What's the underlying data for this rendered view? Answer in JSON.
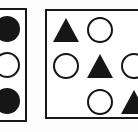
{
  "figure": {
    "title": "",
    "background_color": "#fdfdfd",
    "ink_color": "#161616",
    "border_color": "#191919",
    "panel_fill": "#ffffff"
  },
  "panels": [
    {
      "id": "left-panel",
      "name": "left-panel",
      "cropped_edge": "left",
      "columns": 1,
      "rows": 3,
      "cells": [
        {
          "row": 1,
          "col": 1,
          "shape": "circle",
          "fill": "filled",
          "icon_name": "filled-circle-icon"
        },
        {
          "row": 2,
          "col": 1,
          "shape": "circle",
          "fill": "open",
          "icon_name": "open-circle-icon"
        },
        {
          "row": 3,
          "col": 1,
          "shape": "circle",
          "fill": "filled",
          "icon_name": "filled-circle-icon"
        }
      ]
    },
    {
      "id": "right-panel",
      "name": "right-panel",
      "cropped_edge": "right",
      "columns": 3,
      "rows": 3,
      "cells": [
        {
          "row": 1,
          "col": 1,
          "shape": "triangle",
          "fill": "filled",
          "icon_name": "filled-triangle-icon"
        },
        {
          "row": 1,
          "col": 2,
          "shape": "circle",
          "fill": "open",
          "icon_name": "open-circle-icon"
        },
        {
          "row": 1,
          "col": 3,
          "shape": "none",
          "fill": "none",
          "icon_name": "empty-cell"
        },
        {
          "row": 2,
          "col": 1,
          "shape": "circle",
          "fill": "open",
          "icon_name": "open-circle-icon"
        },
        {
          "row": 2,
          "col": 2,
          "shape": "triangle",
          "fill": "filled",
          "icon_name": "filled-triangle-icon"
        },
        {
          "row": 2,
          "col": 3,
          "shape": "circle",
          "fill": "open",
          "icon_name": "open-circle-icon"
        },
        {
          "row": 3,
          "col": 1,
          "shape": "none",
          "fill": "none",
          "icon_name": "empty-cell"
        },
        {
          "row": 3,
          "col": 2,
          "shape": "circle",
          "fill": "open",
          "icon_name": "open-circle-icon"
        },
        {
          "row": 3,
          "col": 3,
          "shape": "triangle",
          "fill": "filled",
          "icon_name": "filled-triangle-icon"
        }
      ]
    }
  ],
  "counts": {
    "left_filled_circles": 2,
    "left_open_circles": 1,
    "right_filled_triangles": 3,
    "right_open_circles": 4
  }
}
